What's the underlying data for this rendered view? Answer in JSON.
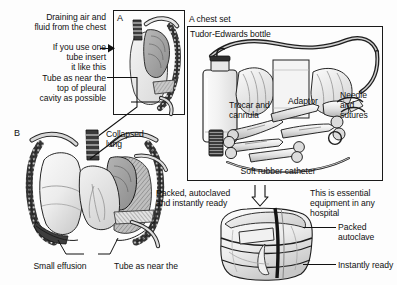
{
  "figure": {
    "background": "#fdfdfd",
    "ink": "#111111"
  },
  "panel_a": {
    "letter": "A",
    "caption_top": "Draining air and\nfluid from the chest",
    "caption_insert": "If you use one\ntube insert\nit like this",
    "caption_tube": "Tube as near the\ntop of pleural\ncavity as possible",
    "description": "Lateral chest illustration showing a drainage tube inserted near the top of the pleural cavity"
  },
  "panel_b": {
    "letter": "B",
    "label_collapsed_lung": "Collapsed\nlung",
    "label_small_effusion": "Small effusion",
    "label_tube": "Tube as near the",
    "description": "Anterior chest illustration with collapsed lung, small effusion and drainage tube"
  },
  "chest_set": {
    "title": "A chest set",
    "bottle_label": "Tudor-Edwards bottle",
    "trocar_label": "Trocar and\ncannula",
    "adaptor_label": "Adaptor",
    "needle_label": "Needle\nand\nsutures",
    "catheter_label": "Soft rubber catheter"
  },
  "autoclave": {
    "packed_note": "Packed, autoclaved\nand instantly ready",
    "essential_note": "This is essential\nequipment in any\nhospital",
    "label_packed": "Packed\nautoclave",
    "label_ready": "Instantly ready",
    "description": "Cloth-wrapped sterile bundle tied with tape"
  }
}
